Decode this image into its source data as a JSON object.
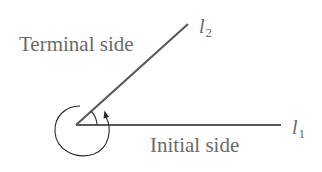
{
  "diagram": {
    "labels": {
      "terminal_side": "Terminal side",
      "initial_side": "Initial side",
      "terminal_ray_name": "l",
      "terminal_ray_sub": "2",
      "initial_ray_name": "l",
      "initial_ray_sub": "1"
    },
    "colors": {
      "line": "#5a5a5a",
      "text": "#6a6a6a",
      "background": "#ffffff"
    },
    "elements": [
      {
        "id": "vertex",
        "type": "point",
        "x": 76,
        "y": 125
      },
      {
        "id": "initial-side",
        "type": "ray",
        "from": [
          76,
          125
        ],
        "to": [
          280,
          125
        ]
      },
      {
        "id": "terminal-side",
        "type": "ray",
        "from": [
          76,
          125
        ],
        "to": [
          188,
          24
        ]
      },
      {
        "id": "angle-arc",
        "type": "arc",
        "note": "small arc between rays near vertex"
      },
      {
        "id": "rotation-loop",
        "type": "arrowed-arc",
        "note": "full-turn loop around vertex ending with arrowhead pointing toward terminal side"
      }
    ]
  }
}
